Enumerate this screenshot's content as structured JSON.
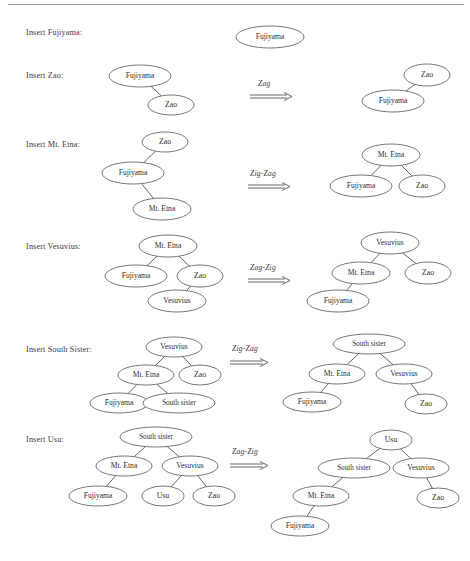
{
  "document": {
    "type": "splay-tree-insertion-sequence",
    "top_rule": true
  },
  "rows": [
    {
      "id": "row-insert-fujiyama",
      "label": "Insert Fujiyama:",
      "label_x": 26,
      "label_y": 33,
      "operation": null,
      "arrow": null,
      "before": null,
      "after": {
        "nodes": [
          {
            "text": "Fujiyama",
            "cx": 270,
            "cy": 37,
            "rx": 34,
            "ry": 11
          }
        ],
        "edges": []
      }
    },
    {
      "id": "row-insert-zao",
      "label": "Insert Zao:",
      "label_x": 26,
      "label_y": 76,
      "operation": "Zag",
      "arrow": {
        "label_x": 258,
        "label_y": 84,
        "glyph_x": 250,
        "glyph_y": 92,
        "glyph_w": 42
      },
      "before": {
        "nodes": [
          {
            "text": "Fujiyama",
            "cx": 140,
            "cy": 76,
            "rx": 31,
            "ry": 11
          },
          {
            "text": "Zao",
            "cx": 171,
            "cy": 105,
            "rx": 23,
            "ry": 10
          }
        ],
        "edges": [
          {
            "from": 0,
            "to": 1
          }
        ]
      },
      "after": {
        "nodes": [
          {
            "text": "Zao",
            "cx": 427,
            "cy": 75,
            "rx": 23,
            "ry": 11
          },
          {
            "text": "Fujiyama",
            "cx": 393,
            "cy": 101,
            "rx": 31,
            "ry": 11
          }
        ],
        "edges": [
          {
            "from": 0,
            "to": 1
          }
        ]
      }
    },
    {
      "id": "row-insert-mt-etna",
      "label": "Insert Mt. Etna:",
      "label_x": 26,
      "label_y": 145,
      "operation": "Zig-Zag",
      "arrow": {
        "label_x": 250,
        "label_y": 174,
        "glyph_x": 248,
        "glyph_y": 182,
        "glyph_w": 42
      },
      "before": {
        "nodes": [
          {
            "text": "Zao",
            "cx": 165,
            "cy": 142,
            "rx": 23,
            "ry": 10
          },
          {
            "text": "Fujiyama",
            "cx": 133,
            "cy": 173,
            "rx": 31,
            "ry": 11
          },
          {
            "text": "Mt. Etna",
            "cx": 162,
            "cy": 209,
            "rx": 29,
            "ry": 11
          }
        ],
        "edges": [
          {
            "from": 0,
            "to": 1
          },
          {
            "from": 1,
            "to": 2
          }
        ]
      },
      "after": {
        "nodes": [
          {
            "text": "Mt. Etna",
            "cx": 391,
            "cy": 155,
            "rx": 29,
            "ry": 11
          },
          {
            "text": "Fujiyama",
            "cx": 361,
            "cy": 186,
            "rx": 31,
            "ry": 11
          },
          {
            "text": "Zao",
            "cx": 422,
            "cy": 186,
            "rx": 23,
            "ry": 11
          }
        ],
        "edges": [
          {
            "from": 0,
            "to": 1
          },
          {
            "from": 0,
            "to": 2
          }
        ]
      }
    },
    {
      "id": "row-insert-vesuvius",
      "label": "Insert Vesuvius:",
      "label_x": 26,
      "label_y": 247,
      "operation": "Zag-Zig",
      "arrow": {
        "label_x": 250,
        "label_y": 268,
        "glyph_x": 248,
        "glyph_y": 276,
        "glyph_w": 42
      },
      "before": {
        "nodes": [
          {
            "text": "Mt. Etna",
            "cx": 168,
            "cy": 246,
            "rx": 29,
            "ry": 11
          },
          {
            "text": "Fujiyama",
            "cx": 136,
            "cy": 276,
            "rx": 31,
            "ry": 11
          },
          {
            "text": "Zao",
            "cx": 200,
            "cy": 276,
            "rx": 23,
            "ry": 11
          },
          {
            "text": "Vesuvius",
            "cx": 177,
            "cy": 301,
            "rx": 29,
            "ry": 11
          }
        ],
        "edges": [
          {
            "from": 0,
            "to": 1
          },
          {
            "from": 0,
            "to": 2
          },
          {
            "from": 2,
            "to": 3
          }
        ]
      },
      "after": {
        "nodes": [
          {
            "text": "Vesuvius",
            "cx": 390,
            "cy": 243,
            "rx": 29,
            "ry": 11
          },
          {
            "text": "Mt. Etna",
            "cx": 361,
            "cy": 273,
            "rx": 29,
            "ry": 11
          },
          {
            "text": "Zao",
            "cx": 428,
            "cy": 273,
            "rx": 23,
            "ry": 11
          },
          {
            "text": "Fujiyama",
            "cx": 338,
            "cy": 301,
            "rx": 31,
            "ry": 11
          }
        ],
        "edges": [
          {
            "from": 0,
            "to": 1
          },
          {
            "from": 0,
            "to": 2
          },
          {
            "from": 1,
            "to": 3
          }
        ]
      }
    },
    {
      "id": "row-insert-south-sister",
      "label": "Insert South Sister:",
      "label_x": 26,
      "label_y": 350,
      "operation": "Zig-Zag",
      "arrow": {
        "label_x": 232,
        "label_y": 349,
        "glyph_x": 230,
        "glyph_y": 358,
        "glyph_w": 38
      },
      "before": {
        "nodes": [
          {
            "text": "Vesuvius",
            "cx": 174,
            "cy": 347,
            "rx": 28,
            "ry": 10
          },
          {
            "text": "Mt. Etna",
            "cx": 146,
            "cy": 375,
            "rx": 28,
            "ry": 10
          },
          {
            "text": "Zao",
            "cx": 200,
            "cy": 375,
            "rx": 21,
            "ry": 10
          },
          {
            "text": "Fujiyama",
            "cx": 119,
            "cy": 403,
            "rx": 29,
            "ry": 10
          },
          {
            "text": "South sister",
            "cx": 179,
            "cy": 403,
            "rx": 36,
            "ry": 10
          }
        ],
        "edges": [
          {
            "from": 0,
            "to": 1
          },
          {
            "from": 0,
            "to": 2
          },
          {
            "from": 1,
            "to": 3
          },
          {
            "from": 1,
            "to": 4
          }
        ]
      },
      "after": {
        "nodes": [
          {
            "text": "South sister",
            "cx": 369,
            "cy": 344,
            "rx": 36,
            "ry": 10
          },
          {
            "text": "Mt. Etna",
            "cx": 337,
            "cy": 374,
            "rx": 28,
            "ry": 10
          },
          {
            "text": "Vesuvius",
            "cx": 404,
            "cy": 374,
            "rx": 28,
            "ry": 10
          },
          {
            "text": "Fujiyama",
            "cx": 312,
            "cy": 402,
            "rx": 29,
            "ry": 10
          },
          {
            "text": "Zao",
            "cx": 426,
            "cy": 404,
            "rx": 21,
            "ry": 10
          }
        ],
        "edges": [
          {
            "from": 0,
            "to": 1
          },
          {
            "from": 0,
            "to": 2
          },
          {
            "from": 1,
            "to": 3
          },
          {
            "from": 2,
            "to": 4
          }
        ]
      }
    },
    {
      "id": "row-insert-usu",
      "label": "Insert Usu:",
      "label_x": 26,
      "label_y": 440,
      "operation": "Zag-Zig",
      "arrow": {
        "label_x": 232,
        "label_y": 452,
        "glyph_x": 230,
        "glyph_y": 461,
        "glyph_w": 38
      },
      "before": {
        "nodes": [
          {
            "text": "South sister",
            "cx": 156,
            "cy": 437,
            "rx": 36,
            "ry": 10
          },
          {
            "text": "Mt. Etna",
            "cx": 124,
            "cy": 466,
            "rx": 28,
            "ry": 10
          },
          {
            "text": "Vesuvius",
            "cx": 190,
            "cy": 466,
            "rx": 28,
            "ry": 10
          },
          {
            "text": "Fujiyama",
            "cx": 98,
            "cy": 496,
            "rx": 29,
            "ry": 10
          },
          {
            "text": "Usu",
            "cx": 163,
            "cy": 496,
            "rx": 21,
            "ry": 10
          },
          {
            "text": "Zao",
            "cx": 214,
            "cy": 496,
            "rx": 21,
            "ry": 10
          }
        ],
        "edges": [
          {
            "from": 0,
            "to": 1
          },
          {
            "from": 0,
            "to": 2
          },
          {
            "from": 1,
            "to": 3
          },
          {
            "from": 2,
            "to": 4
          },
          {
            "from": 2,
            "to": 5
          }
        ]
      },
      "after": {
        "nodes": [
          {
            "text": "Usu",
            "cx": 391,
            "cy": 440,
            "rx": 21,
            "ry": 10
          },
          {
            "text": "South sister",
            "cx": 354,
            "cy": 468,
            "rx": 36,
            "ry": 10
          },
          {
            "text": "Vesuvius",
            "cx": 421,
            "cy": 468,
            "rx": 28,
            "ry": 10
          },
          {
            "text": "Mt. Etna",
            "cx": 321,
            "cy": 496,
            "rx": 28,
            "ry": 10
          },
          {
            "text": "Zao",
            "cx": 438,
            "cy": 498,
            "rx": 21,
            "ry": 10
          },
          {
            "text": "Fujiyama",
            "cx": 300,
            "cy": 526,
            "rx": 29,
            "ry": 10
          }
        ],
        "edges": [
          {
            "from": 0,
            "to": 1
          },
          {
            "from": 0,
            "to": 2
          },
          {
            "from": 1,
            "to": 3
          },
          {
            "from": 2,
            "to": 4
          },
          {
            "from": 3,
            "to": 5
          }
        ]
      }
    }
  ],
  "colors": {
    "stroke": "#56565a",
    "text": "#2e2e2e",
    "rule": "#9a9a9a"
  }
}
